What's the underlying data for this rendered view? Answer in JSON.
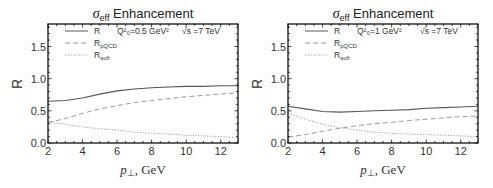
{
  "chart_data": [
    {
      "type": "line",
      "title": "σ_eff Enhancement",
      "title_main": "Enhancement",
      "title_symbol": "σ",
      "title_sub": "eff",
      "xlabel": "p⊥, GeV",
      "ylabel": "R",
      "xlim": [
        2,
        13
      ],
      "ylim": [
        0,
        1.85
      ],
      "xticks": [
        "2",
        "4",
        "6",
        "8",
        "10",
        "12"
      ],
      "yticks": [
        "0.0",
        "0.5",
        "1.0",
        "1.5"
      ],
      "annotations": {
        "q2": "Q²₀=0.5 GeV²",
        "sqrts": "√s =7 TeV"
      },
      "legend_position": "top-left inside",
      "x": [
        2,
        3,
        4,
        5,
        6,
        7,
        8,
        9,
        10,
        11,
        12,
        13
      ],
      "series": [
        {
          "name": "R",
          "style": "solid",
          "values": [
            0.65,
            0.66,
            0.7,
            0.76,
            0.81,
            0.84,
            0.86,
            0.87,
            0.88,
            0.88,
            0.89,
            0.89
          ]
        },
        {
          "name": "R_pQCD",
          "style": "dashed",
          "values": [
            0.32,
            0.38,
            0.46,
            0.53,
            0.58,
            0.63,
            0.66,
            0.69,
            0.72,
            0.74,
            0.76,
            0.78
          ]
        },
        {
          "name": "R_soft",
          "style": "dotted",
          "values": [
            0.33,
            0.29,
            0.25,
            0.22,
            0.2,
            0.17,
            0.15,
            0.14,
            0.12,
            0.11,
            0.1,
            0.08
          ]
        }
      ]
    },
    {
      "type": "line",
      "title": "σ_eff Enhancement",
      "title_main": "Enhancement",
      "title_symbol": "σ",
      "title_sub": "eff",
      "xlabel": "p⊥, GeV",
      "ylabel": "R",
      "xlim": [
        2,
        13
      ],
      "ylim": [
        0,
        1.85
      ],
      "xticks": [
        "2",
        "4",
        "6",
        "8",
        "10",
        "12"
      ],
      "yticks": [
        "0.0",
        "0.5",
        "1.0",
        "1.5"
      ],
      "annotations": {
        "q2": "Q²₀=1 GeV²",
        "sqrts": "√s =7 TeV"
      },
      "legend_position": "top-left inside",
      "x": [
        2,
        3,
        4,
        5,
        6,
        7,
        8,
        9,
        10,
        11,
        12,
        13
      ],
      "series": [
        {
          "name": "R",
          "style": "solid",
          "values": [
            0.57,
            0.53,
            0.49,
            0.48,
            0.49,
            0.5,
            0.51,
            0.52,
            0.54,
            0.55,
            0.56,
            0.57
          ]
        },
        {
          "name": "R_pQCD",
          "style": "dashed",
          "values": [
            0.09,
            0.13,
            0.18,
            0.23,
            0.27,
            0.3,
            0.32,
            0.35,
            0.37,
            0.39,
            0.41,
            0.42
          ]
        },
        {
          "name": "R_soft",
          "style": "dotted",
          "values": [
            0.46,
            0.37,
            0.29,
            0.24,
            0.2,
            0.17,
            0.15,
            0.14,
            0.13,
            0.12,
            0.11,
            0.1
          ]
        }
      ]
    }
  ],
  "legend": {
    "items": [
      {
        "label": "R",
        "sub": ""
      },
      {
        "label": "R",
        "sub": "pQCD"
      },
      {
        "label": "R",
        "sub": "soft"
      }
    ]
  },
  "colors": {
    "R": "#555555",
    "R_pQCD": "#9a9a9a",
    "R_soft": "#9a9a9a",
    "frame": "#111111"
  }
}
